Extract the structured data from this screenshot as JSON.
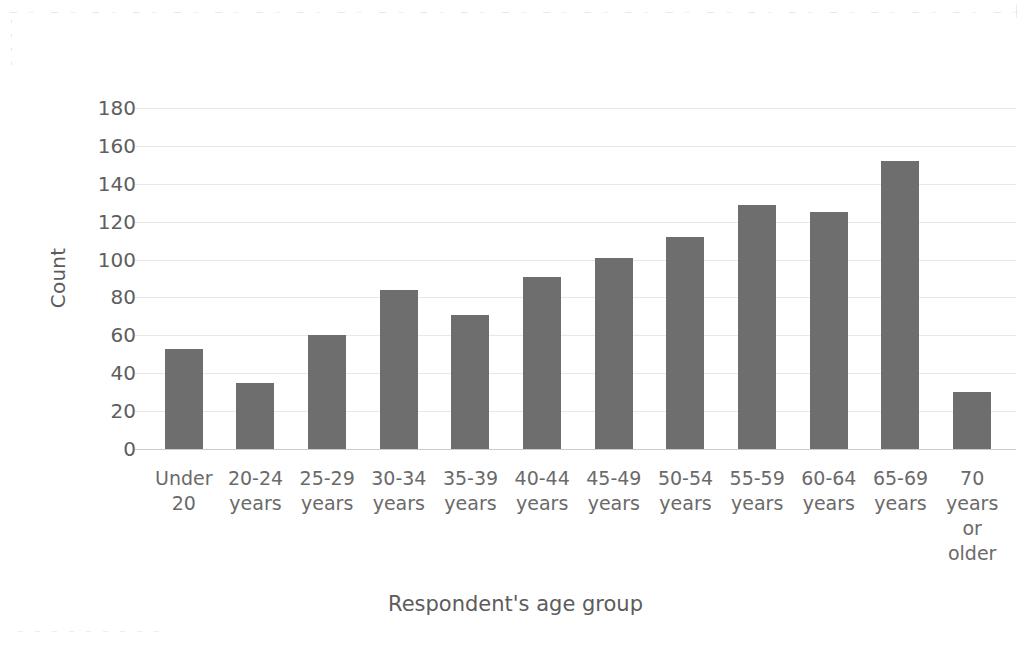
{
  "chart_data": {
    "type": "bar",
    "title": "",
    "xlabel": "Respondent's age group",
    "ylabel": "Count",
    "categories": [
      "Under\n20",
      "20-24\nyears",
      "25-29\nyears",
      "30-34\nyears",
      "35-39\nyears",
      "40-44\nyears",
      "45-49\nyears",
      "50-54\nyears",
      "55-59\nyears",
      "60-64\nyears",
      "65-69\nyears",
      "70\nyears\nor\nolder"
    ],
    "values": [
      53,
      35,
      60,
      84,
      71,
      91,
      101,
      112,
      129,
      125,
      152,
      30
    ],
    "ylim": [
      0,
      180
    ],
    "ytick_values": [
      0,
      20,
      40,
      60,
      80,
      100,
      120,
      140,
      160,
      180
    ],
    "ytick_labels": [
      "0",
      "20",
      "40",
      "60",
      "80",
      "100",
      "120",
      "140",
      "160",
      "180"
    ],
    "grid": true,
    "grid_axis": "y",
    "legend": false,
    "bar_color": "#6e6e6e",
    "axis_text_color": "#5e5e5e",
    "background_color": "#ffffff"
  }
}
